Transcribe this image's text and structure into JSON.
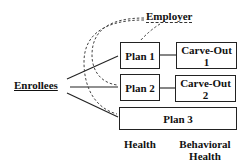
{
  "diagram": {
    "type": "flow",
    "nodes": {
      "enrollees": "Enrollees",
      "employer": "Employer",
      "plan1": "Plan 1",
      "plan2": "Plan 2",
      "plan3": "Plan 3",
      "carveout1_line1": "Carve-Out",
      "carveout1_line2": "1",
      "carveout2_line1": "Carve-Out",
      "carveout2_line2": "2"
    },
    "columns": {
      "health": "Health",
      "behavioral_line1": "Behavioral",
      "behavioral_line2": "Health"
    },
    "edges": [
      {
        "from": "Enrollees",
        "to": "Plan 1",
        "style": "solid"
      },
      {
        "from": "Enrollees",
        "to": "Plan 2",
        "style": "solid"
      },
      {
        "from": "Enrollees",
        "to": "Plan 3",
        "style": "solid"
      },
      {
        "from": "Plan 1",
        "to": "Carve-Out 1",
        "style": "solid"
      },
      {
        "from": "Plan 2",
        "to": "Carve-Out 2",
        "style": "solid"
      },
      {
        "from": "Employer",
        "to": "Plan 1",
        "style": "dashed"
      },
      {
        "from": "Employer",
        "to": "Plan 2",
        "style": "dashed"
      },
      {
        "from": "Employer",
        "to": "Plan 3",
        "style": "dashed"
      }
    ],
    "colors": {
      "stroke": "#222222",
      "background": "#ffffff"
    }
  }
}
